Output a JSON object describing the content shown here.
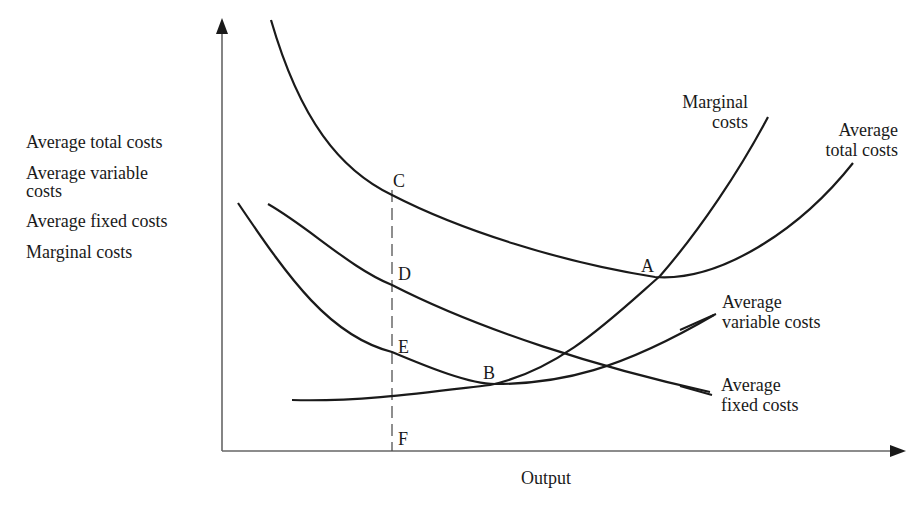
{
  "chart_data": {
    "type": "line",
    "title": "",
    "xlabel": "Output",
    "ylabel_lines": [
      "Average total costs",
      "Average variable",
      "costs",
      "Average fixed costs",
      "Marginal costs"
    ],
    "grid": false,
    "axes": {
      "x_origin_px": 222,
      "y_origin_px": 451,
      "x_end_px": 905,
      "y_top_px": 18
    },
    "series": [
      {
        "name": "Marginal costs",
        "label_lines": [
          "Marginal",
          "costs"
        ],
        "path": "M292,400 C360,402 430,392 490,385 C560,370 610,320 660,276 C700,230 740,170 768,117"
      },
      {
        "name": "Average total costs",
        "label_lines": [
          "Average",
          "total costs"
        ],
        "path": "M271,20 C300,120 340,170 392,195 C460,230 560,262 655,277 C720,282 800,230 853,163"
      },
      {
        "name": "Average variable costs",
        "label_lines": [
          "Average",
          "variable costs"
        ],
        "path": "M238,203 C290,280 330,336 392,352 C430,368 470,384 495,384 C560,384 620,370 714,315"
      },
      {
        "name": "Average fixed costs",
        "label_lines": [
          "Average",
          "fixed costs"
        ],
        "path": "M268,204 C310,228 350,268 392,285 C480,330 600,368 710,392"
      }
    ],
    "dashed_line": {
      "x_px": 392,
      "y_from_px": 190,
      "y_to_px": 451
    },
    "points": [
      {
        "label": "C",
        "x": 393,
        "y": 180
      },
      {
        "label": "D",
        "x": 398,
        "y": 273
      },
      {
        "label": "E",
        "x": 398,
        "y": 346
      },
      {
        "label": "B",
        "x": 483,
        "y": 372
      },
      {
        "label": "A",
        "x": 641,
        "y": 265
      },
      {
        "label": "F",
        "x": 398,
        "y": 438
      }
    ]
  },
  "labels": {
    "y_axis": [
      "Average total costs",
      "Average variable",
      "costs",
      "Average fixed costs",
      "Marginal costs"
    ],
    "x_axis": "Output",
    "mc": [
      "Marginal",
      "costs"
    ],
    "atc": [
      "Average",
      "total costs"
    ],
    "avc": [
      "Average",
      "variable costs"
    ],
    "afc": [
      "Average",
      "fixed costs"
    ],
    "points": {
      "A": "A",
      "B": "B",
      "C": "C",
      "D": "D",
      "E": "E",
      "F": "F"
    }
  },
  "colors": {
    "ink": "#1a1a1a",
    "axis": "#555555",
    "background": "#ffffff"
  }
}
